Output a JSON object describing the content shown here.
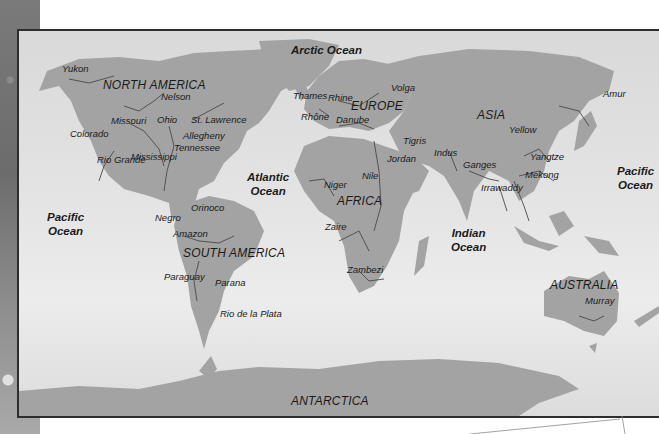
{
  "map": {
    "colors": {
      "land": "#a3a3a3",
      "ocean": "#e2e2e2",
      "river": "#4a4a4a",
      "frame": "#2d2d2d"
    },
    "oceans": [
      {
        "id": "arctic",
        "label": "Arctic Ocean"
      },
      {
        "id": "atlantic",
        "line1": "Atlantic",
        "line2": "Ocean"
      },
      {
        "id": "pacific-west",
        "line1": "Pacific",
        "line2": "Ocean"
      },
      {
        "id": "pacific-east",
        "line1": "Pacific",
        "line2": "Ocean"
      },
      {
        "id": "indian",
        "line1": "Indian",
        "line2": "Ocean"
      }
    ],
    "continents": [
      "NORTH AMERICA",
      "SOUTH AMERICA",
      "EUROPE",
      "AFRICA",
      "ASIA",
      "AUSTRALIA",
      "ANTARCTICA"
    ],
    "rivers": {
      "north_america": [
        "Yukon",
        "Nelson",
        "Missouri",
        "Ohio",
        "St. Lawrence",
        "Colorado",
        "Allegheny",
        "Tennessee",
        "Rio Grande",
        "Mississippi"
      ],
      "south_america": [
        "Orinoco",
        "Negro",
        "Amazon",
        "Paraguay",
        "Parana",
        "Rio de la Plata"
      ],
      "europe": [
        "Thames",
        "Rhine",
        "Volga",
        "Rhône",
        "Danube"
      ],
      "africa": [
        "Nile",
        "Niger",
        "Zaire",
        "Zambezi"
      ],
      "asia": [
        "Tigris",
        "Jordan",
        "Indus",
        "Ganges",
        "Amur",
        "Yellow",
        "Yangtze",
        "Mekong",
        "Irrawaddy"
      ],
      "australia": [
        "Murray"
      ]
    }
  }
}
